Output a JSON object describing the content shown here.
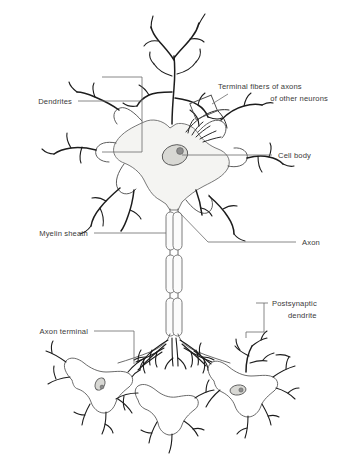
{
  "figure": {
    "background_color": "#ffffff",
    "ink_color": "#1c1c1c",
    "soma_fill": "#f4f4f2",
    "nucleus_fill": "#d8d8d4",
    "nucleolus_fill": "#8d8d8d",
    "myelin_fill": "#fbfbfb",
    "leader_color": "#6b6b6b"
  },
  "labels": {
    "dendrites": "Dendrites",
    "terminal_fibers_line1": "Terminal fibers of axons",
    "terminal_fibers_line2": "of  other neurons",
    "cell_body": "Cell body",
    "myelin_sheath": "Myelin sheath",
    "axon": "Axon",
    "postsynaptic_line1": "Postsynaptic",
    "postsynaptic_line2": "dendrite",
    "axon_terminal": "Axon terminal"
  },
  "parts": [
    {
      "name": "dendrites",
      "label": "Dendrites",
      "side": "left",
      "connector": "bracket"
    },
    {
      "name": "terminal-fibers-of-axons",
      "label": "Terminal fibers of axons of other neurons",
      "side": "right",
      "connector": "box-leader"
    },
    {
      "name": "cell-body",
      "label": "Cell body",
      "side": "right",
      "connector": "line"
    },
    {
      "name": "myelin-sheath",
      "label": "Myelin sheath",
      "side": "left",
      "connector": "line"
    },
    {
      "name": "axon",
      "label": "Axon",
      "side": "right",
      "connector": "line"
    },
    {
      "name": "postsynaptic-dendrite",
      "label": "Postsynaptic dendrite",
      "side": "right",
      "connector": "bracket"
    },
    {
      "name": "axon-terminal",
      "label": "Axon terminal",
      "side": "left",
      "connector": "line"
    }
  ],
  "structure": {
    "myelin_segment_count": 3,
    "postsynaptic_neuron_count": 3,
    "nucleus_count": 3
  }
}
